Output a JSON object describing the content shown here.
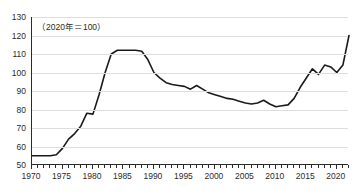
{
  "title": "",
  "note": "（2020年＝100）",
  "colors": {
    "line": "#1a1a1a",
    "grid": "#dddde1",
    "axis": "#2b2b2b",
    "background": "#ffffff"
  },
  "chart_data": {
    "type": "line",
    "title": "",
    "xlabel": "",
    "ylabel": "",
    "annotations": [
      "（2020年＝100）"
    ],
    "grid": true,
    "legend": "none",
    "ylim": [
      50,
      130
    ],
    "xlim": [
      1970,
      2022
    ],
    "yticks": [
      50,
      60,
      70,
      80,
      90,
      100,
      110,
      120,
      130
    ],
    "xticks": [
      1970,
      1975,
      1980,
      1985,
      1990,
      1995,
      2000,
      2005,
      2010,
      2015,
      2020
    ],
    "xtick_minor_interval": 1,
    "series": [
      {
        "name": "指数",
        "x": [
          1970,
          1971,
          1972,
          1973,
          1974,
          1975,
          1976,
          1977,
          1978,
          1979,
          1980,
          1981,
          1982,
          1983,
          1984,
          1985,
          1986,
          1987,
          1988,
          1989,
          1990,
          1991,
          1992,
          1993,
          1994,
          1995,
          1996,
          1997,
          1998,
          1999,
          2000,
          2001,
          2002,
          2003,
          2004,
          2005,
          2006,
          2007,
          2008,
          2009,
          2010,
          2011,
          2012,
          2013,
          2014,
          2015,
          2016,
          2017,
          2018,
          2019,
          2020,
          2021,
          2022
        ],
        "values": [
          55,
          55,
          55,
          55,
          55.5,
          59,
          64,
          67,
          71,
          78,
          77.5,
          88,
          100,
          110,
          112,
          112,
          112,
          112,
          111.5,
          107,
          100,
          97,
          94.5,
          93.5,
          93,
          92.5,
          91,
          93,
          91,
          89,
          88,
          87,
          86,
          85.5,
          84.5,
          83.5,
          83,
          83.5,
          85,
          83,
          81.5,
          82,
          82.5,
          86,
          92,
          97,
          102,
          99,
          104,
          103,
          100,
          104,
          120
        ]
      }
    ]
  }
}
